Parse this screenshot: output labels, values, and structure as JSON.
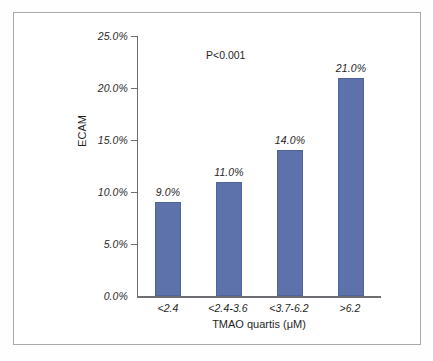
{
  "chart_data": {
    "type": "bar",
    "title": "",
    "subtitle": "",
    "xlabel": "TMAO quartis (μM)",
    "ylabel": "ECAM",
    "categories": [
      "<2.4",
      "<2.4-3.6",
      "<3.7-6.2",
      ">6.2"
    ],
    "values": [
      9.0,
      11.0,
      14.0,
      21.0
    ],
    "value_labels": [
      "9.0%",
      "11.0%",
      "14.0%",
      "21.0%"
    ],
    "ylim": [
      0,
      25
    ],
    "ytick_values": [
      0,
      5,
      10,
      15,
      20,
      25
    ],
    "ytick_labels": [
      "0.0%",
      "5.0%",
      "10.0%",
      "15.0%",
      "20.0%",
      "25.0%"
    ],
    "grid": false,
    "legend": false,
    "legend_position": "none",
    "annotations": [
      {
        "text": "P<0.001",
        "x": 2.0,
        "y": 23.5
      }
    ],
    "series": [
      {
        "name": "ECAM",
        "values": [
          9.0,
          11.0,
          14.0,
          21.0
        ],
        "color": "#5d72ab"
      }
    ]
  },
  "colors": {
    "bar_fill": "#5d72ab",
    "bar_stroke": "#51649a",
    "axis_line": "#6e6e73",
    "frame_border": "#a9a9ad",
    "text": "#1f1f1f",
    "background": "#ffffff"
  }
}
